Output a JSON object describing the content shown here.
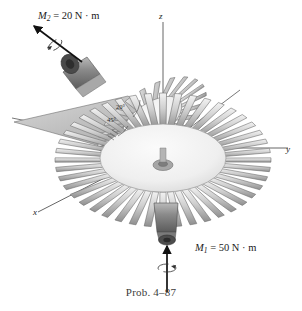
{
  "figure": {
    "caption": "Prob. 4–87",
    "background_color": "#ffffff",
    "ink_color": "#1a1a1a",
    "body_fill_light": "#e9e9e9",
    "body_fill_mid": "#c4c4c4",
    "body_fill_dark": "#8d8d8d",
    "shaft_dark": "#6f6f6f"
  },
  "axes": {
    "z": {
      "label": "z"
    },
    "y": {
      "label": "y"
    },
    "x": {
      "label": "x"
    }
  },
  "moments": [
    {
      "id": "M1",
      "symbol": "M",
      "subscript": "1",
      "equals": "=",
      "value": "50",
      "unit": "N · m",
      "full_label": "M₁ = 50 N · m",
      "direction": "up-vertical",
      "location": "bottom-shaft"
    },
    {
      "id": "M2",
      "symbol": "M",
      "subscript": "2",
      "equals": "=",
      "value": "20",
      "unit": "N · m",
      "full_label": "M₂ = 20 N · m",
      "direction": "up-left-diagonal",
      "location": "inclined-shaft"
    }
  ],
  "angles": [
    {
      "id": "a20",
      "text": "20°"
    },
    {
      "id": "a45",
      "text": "45°"
    }
  ],
  "object": {
    "name": "turbine-impeller",
    "blade_count_main": 44,
    "blade_count_inclined": 22
  }
}
